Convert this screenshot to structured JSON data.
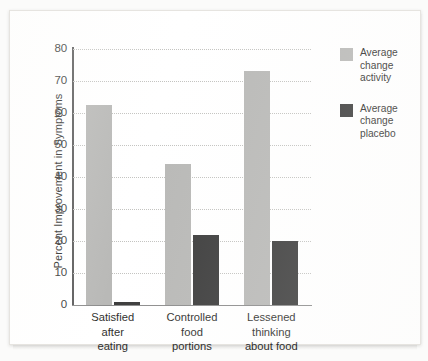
{
  "chart_data": {
    "type": "bar",
    "title": "",
    "xlabel": "",
    "ylabel": "Percent Improvement in Symptoms",
    "ylim": [
      0,
      80
    ],
    "yticks": [
      0,
      10,
      20,
      30,
      40,
      50,
      60,
      70,
      80
    ],
    "ytick_labels": [
      "0",
      "10",
      "20",
      "30",
      "40",
      "50",
      "60",
      "70",
      "80"
    ],
    "grid": true,
    "legend_position": "right",
    "categories": [
      "Satisfied after eating",
      "Controlled food portions",
      "Lessened thinking about food"
    ],
    "category_lines": [
      [
        "Satisfied",
        "after",
        "eating"
      ],
      [
        "Controlled",
        "food",
        "portions"
      ],
      [
        "Lessened",
        "thinking",
        "about food"
      ]
    ],
    "series": [
      {
        "name": "Average change activity",
        "name_lines": [
          "Average",
          "change",
          "activity"
        ],
        "color": "#b9b9b7",
        "values": [
          62.5,
          44,
          73
        ]
      },
      {
        "name": "Average change placebo",
        "name_lines": [
          "Average",
          "change",
          "placebo"
        ],
        "color": "#3d3d3d",
        "values": [
          1,
          22,
          20
        ]
      }
    ]
  },
  "colors": {
    "activity": "#b9b9b7",
    "placebo": "#3d3d3d",
    "axis": "#5d5d5d",
    "grid": "#c3c3c0",
    "text": "#2f2f2d",
    "paper": "#ffffff"
  }
}
